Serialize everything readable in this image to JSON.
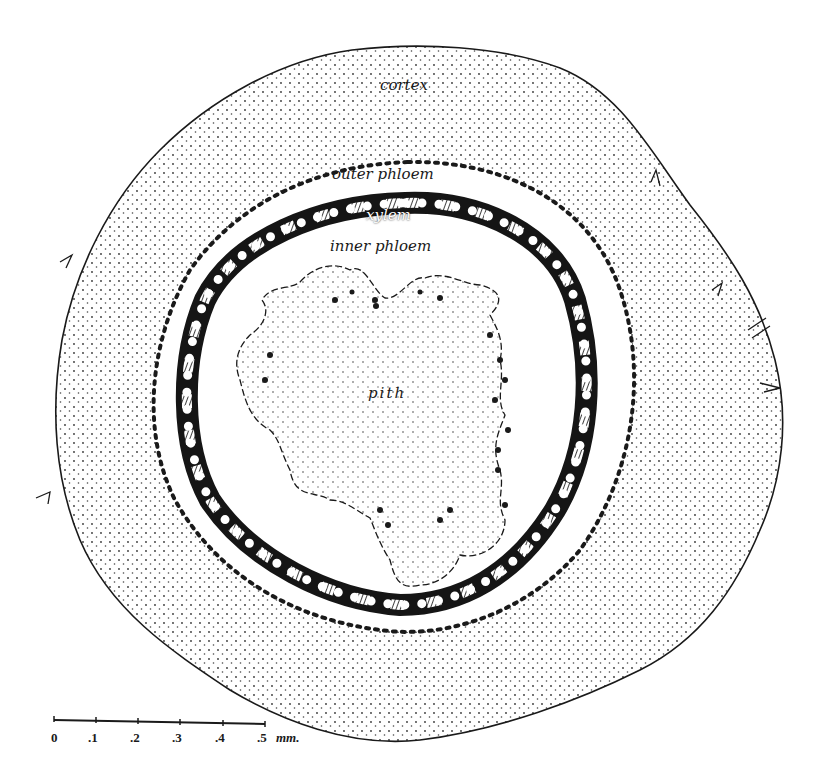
{
  "figure": {
    "labels": {
      "cortex": "cortex",
      "outer_phloem": "outer phloem",
      "xylem": "xylem",
      "inner_phloem": "inner phloem",
      "pith": "pith"
    },
    "scale_bar": {
      "ticks": [
        "0",
        ".1",
        ".2",
        ".3",
        ".4",
        ".5"
      ],
      "unit": "mm."
    },
    "colors": {
      "ink": "#1a1a1a",
      "background": "#ffffff",
      "stipple": "#333333"
    }
  }
}
